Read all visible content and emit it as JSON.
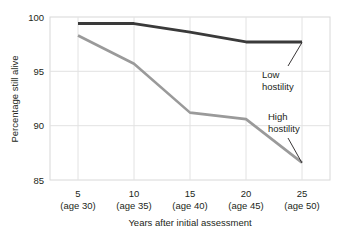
{
  "chart_data": {
    "type": "line",
    "title": "",
    "xlabel": "Years after initial assessment",
    "ylabel": "Percentage still alive",
    "x": [
      5,
      10,
      15,
      20,
      25
    ],
    "categories": [
      "5",
      "10",
      "15",
      "20",
      "25"
    ],
    "x_sublabels": [
      "(age 30)",
      "(age 35)",
      "(age 40)",
      "(age 45)",
      "(age 50)"
    ],
    "xlim": [
      2.5,
      27.5
    ],
    "ylim": [
      85,
      100
    ],
    "y_ticks": [
      "85",
      "90",
      "95",
      "100"
    ],
    "y_tick_values": [
      85,
      90,
      95,
      100
    ],
    "grid": true,
    "legend_position": "inline-annotations",
    "series": [
      {
        "name": "Low hostility",
        "color": "#3a3a3a",
        "values": [
          99.4,
          99.4,
          98.6,
          97.7,
          97.7
        ]
      },
      {
        "name": "High hostility",
        "color": "#9a9a9a",
        "values": [
          98.3,
          95.7,
          91.2,
          90.6,
          86.6
        ]
      }
    ],
    "annotations": [
      {
        "text_line1": "Low",
        "text_line2": "hostility",
        "series": "Low hostility"
      },
      {
        "text_line1": "High",
        "text_line2": "hostility",
        "series": "High hostility"
      }
    ]
  },
  "colors": {
    "low_hostility": "#3a3a3a",
    "high_hostility": "#9a9a9a",
    "grid": "#e2e2e2",
    "frame": "#d8d8d8",
    "text": "#231f20",
    "background": "#ffffff"
  }
}
